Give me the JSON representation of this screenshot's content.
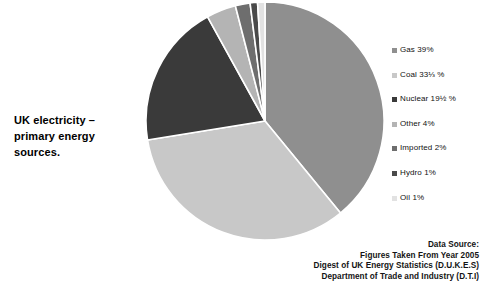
{
  "title": {
    "line1": "UK electricity –",
    "line2": "primary energy",
    "line3": "sources."
  },
  "legend": {
    "items": [
      {
        "label": "Gas 39%",
        "swatch": "#8f8f8f"
      },
      {
        "label": "Coal 33⅓ %",
        "swatch": "#c8c8c8"
      },
      {
        "label": "Nuclear 19½ %",
        "swatch": "#3a3a3a"
      },
      {
        "label": "Other 4%",
        "swatch": "#b4b4b4"
      },
      {
        "label": "Imported 2%",
        "swatch": "#6e6e6e"
      },
      {
        "label": "Hydro 1%",
        "swatch": "#4a4a4a"
      },
      {
        "label": "Oil 1%",
        "swatch": "#e2e2e2"
      }
    ]
  },
  "source": {
    "heading": "Data Source:",
    "line2": "Figures Taken From Year  2005",
    "line3": "Digest of UK Energy Statistics  (D.U.K.E.S)",
    "line4": "Department of Trade and Industry (D.T.I)"
  },
  "chart_data": {
    "type": "pie",
    "title": "UK electricity – primary energy sources.",
    "legend_position": "right",
    "start_angle_deg": 0,
    "direction": "clockwise",
    "units": "percent",
    "categories": [
      "Gas",
      "Coal",
      "Nuclear",
      "Other",
      "Imported",
      "Hydro",
      "Oil"
    ],
    "values": [
      39,
      33.3333,
      19.5,
      4,
      2,
      1,
      1
    ],
    "labels": [
      "Gas 39%",
      "Coal 33⅓ %",
      "Nuclear 19½ %",
      "Other 4%",
      "Imported 2%",
      "Hydro 1%",
      "Oil 1%"
    ],
    "colors": [
      "#8f8f8f",
      "#c8c8c8",
      "#3a3a3a",
      "#b4b4b4",
      "#6e6e6e",
      "#4a4a4a",
      "#e2e2e2"
    ],
    "slice_separator_color": "#ffffff",
    "source_note": "Figures Taken From Year 2005; Digest of UK Energy Statistics (D.U.K.E.S); Department of Trade and Industry (D.T.I)"
  },
  "geometry": {
    "cx": 119,
    "cy": 121,
    "r": 119
  }
}
